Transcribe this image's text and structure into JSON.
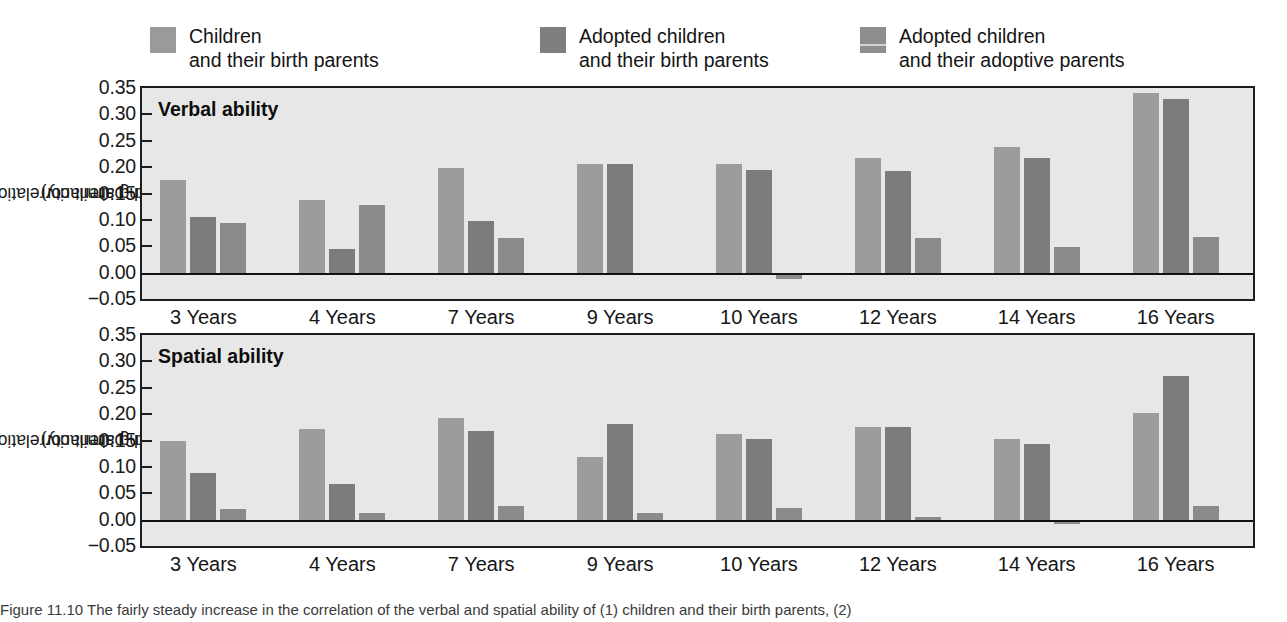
{
  "figure": {
    "y_axis_label_line1": "Child–parent correlation",
    "y_axis_label_line2": "(increasing similarity)",
    "caption": "Figure 11.10  The fairly steady increase in the correlation of the verbal and spatial ability of (1) children and their birth parents, (2)"
  },
  "legend": {
    "items": [
      {
        "label": "Children\nand their birth parents",
        "color": "#9a9a9a",
        "swatch": "legend-swatch-children-birth"
      },
      {
        "label": "Adopted children\nand their birth parents",
        "color": "#7e7e7e",
        "swatch": "legend-swatch-adopted-birth"
      },
      {
        "label": "Adopted children\nand their adoptive parents",
        "color": "#8e8e8e",
        "swatch": "legend-swatch-adopted-adoptive"
      }
    ]
  },
  "chart_data": [
    {
      "type": "bar",
      "title": "Verbal ability",
      "xlabel": "",
      "ylabel": "Child–parent correlation (increasing similarity)",
      "ylim": [
        -0.05,
        0.35
      ],
      "yticks": [
        0.35,
        0.3,
        0.25,
        0.2,
        0.15,
        0.1,
        0.05,
        0.0,
        -0.05
      ],
      "ytick_labels": [
        "0.35",
        "0.30",
        "0.25",
        "0.20",
        "0.15",
        "0.10",
        "0.05",
        "0.00",
        "−0.05"
      ],
      "grid": false,
      "legend_position": "top",
      "categories": [
        "3 Years",
        "4 Years",
        "7 Years",
        "9 Years",
        "10 Years",
        "12 Years",
        "14 Years",
        "16 Years"
      ],
      "series": [
        {
          "name": "Children and their birth parents",
          "values": [
            0.175,
            0.137,
            0.198,
            0.205,
            0.205,
            0.218,
            0.238,
            0.34
          ]
        },
        {
          "name": "Adopted children and their birth parents",
          "values": [
            0.105,
            0.045,
            0.097,
            0.205,
            0.195,
            0.193,
            0.218,
            0.33
          ]
        },
        {
          "name": "Adopted children and their adoptive parents",
          "values": [
            0.095,
            0.128,
            0.065,
            null,
            -0.012,
            0.065,
            0.048,
            0.068
          ]
        }
      ]
    },
    {
      "type": "bar",
      "title": "Spatial ability",
      "xlabel": "",
      "ylabel": "Child–parent correlation (increasing similarity)",
      "ylim": [
        -0.05,
        0.35
      ],
      "yticks": [
        0.35,
        0.3,
        0.25,
        0.2,
        0.15,
        0.1,
        0.05,
        0.0,
        -0.05
      ],
      "ytick_labels": [
        "0.35",
        "0.30",
        "0.25",
        "0.20",
        "0.15",
        "0.10",
        "0.05",
        "0.00",
        "−0.05"
      ],
      "grid": false,
      "legend_position": "top",
      "categories": [
        "3 Years",
        "4 Years",
        "7 Years",
        "9 Years",
        "10 Years",
        "12 Years",
        "14 Years",
        "16 Years"
      ],
      "series": [
        {
          "name": "Children and their birth parents",
          "values": [
            0.15,
            0.172,
            0.192,
            0.118,
            0.163,
            0.175,
            0.153,
            0.202
          ]
        },
        {
          "name": "Adopted children and their birth parents",
          "values": [
            0.088,
            0.067,
            0.168,
            0.182,
            0.153,
            0.175,
            0.143,
            0.272
          ]
        },
        {
          "name": "Adopted children and their adoptive parents",
          "values": [
            0.02,
            0.012,
            0.025,
            0.013,
            0.022,
            0.005,
            -0.008,
            0.025
          ]
        }
      ]
    }
  ]
}
